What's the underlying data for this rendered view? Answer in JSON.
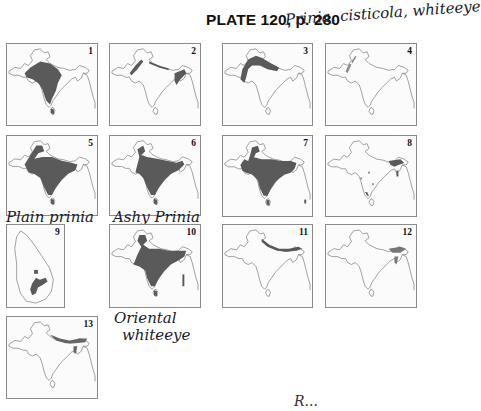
{
  "header": {
    "title": "PLATE 120, p. 280",
    "annotation_top": "Prinia, cisticola, whiteeye"
  },
  "annotations": {
    "map5_label": "Plain prinia",
    "map6_label": "Ashy Prinia",
    "map10_label_line1": "Oriental",
    "map10_label_line2": "whiteeye",
    "bottom_fragment": "R..."
  },
  "maps": [
    {
      "number": "1",
      "shading": "central and western peninsula, Sri Lanka"
    },
    {
      "number": "2",
      "shading": "Himalayan foothills and NE, thin bands"
    },
    {
      "number": "3",
      "shading": "northwest plains and Indus"
    },
    {
      "number": "4",
      "shading": "faint northwest streaks"
    },
    {
      "number": "5",
      "shading": "most of peninsula, Sri Lanka"
    },
    {
      "number": "6",
      "shading": "most of peninsula, Sri Lanka"
    },
    {
      "number": "7",
      "shading": "most of subcontinent, Sri Lanka"
    },
    {
      "number": "8",
      "shading": "NE and scattered peninsula spots"
    },
    {
      "number": "9",
      "shading": "south-central Sri Lanka"
    },
    {
      "number": "10",
      "shading": "most of peninsula, Sri Lanka"
    },
    {
      "number": "11",
      "shading": "Himalayan band"
    },
    {
      "number": "12",
      "shading": "eastern Himalaya and NE"
    },
    {
      "number": "13",
      "shading": "Himalayan band and NE"
    }
  ],
  "colors": {
    "range_fill": "#5a5a5a",
    "outline": "#777777",
    "ink": "#1a1a2a"
  }
}
